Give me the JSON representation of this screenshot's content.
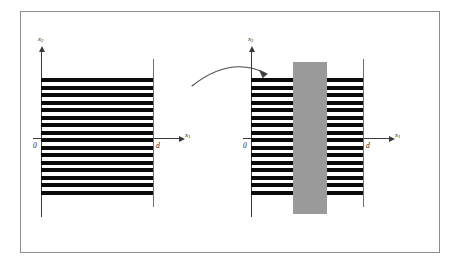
{
  "figure": {
    "kind": "two-panel-diagram",
    "background_color": "#ffffff",
    "frame_color": "#8d8d8d",
    "stripe_color": "#0a0a0a",
    "axis_color": "#3a3a3a",
    "slab_color": "#9a9a9a"
  },
  "panels": [
    {
      "id": "left",
      "name": "undeformed-periodic-layers",
      "vertical_axis_label": "x",
      "vertical_axis_subscript": "2",
      "horizontal_axis_label": "x",
      "horizontal_axis_subscript": "1",
      "origin_label": "0",
      "thickness_label": "d",
      "stripe_count": 16,
      "has_slab": false
    },
    {
      "id": "right",
      "name": "layers-with-grey-inclusion-band",
      "vertical_axis_label": "x",
      "vertical_axis_subscript": "2",
      "horizontal_axis_label": "x",
      "horizontal_axis_subscript": "1",
      "origin_label": "0",
      "thickness_label": "d",
      "stripe_count": 16,
      "has_slab": true
    }
  ],
  "arrow": {
    "name": "transformation-arrow",
    "shape": "curved-right",
    "color": "#4a4a4a"
  },
  "stripe_geometry": {
    "top": 66,
    "bottom": 186,
    "period": 7.5,
    "black_height": 4.2,
    "left_x": 12,
    "width": 112
  },
  "slab_geometry": {
    "left": 54,
    "top": 50,
    "width": 34,
    "height": 152
  }
}
